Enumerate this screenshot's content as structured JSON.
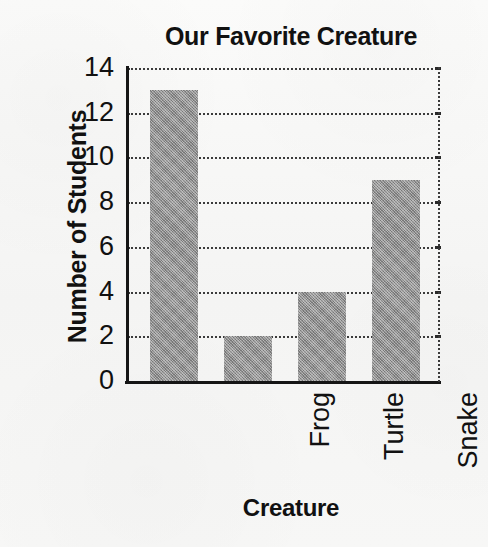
{
  "chart_data": {
    "type": "bar",
    "title": "Our Favorite Creature",
    "xlabel": "Creature",
    "ylabel": "Number of Students",
    "categories": [
      "Frog",
      "Turtle",
      "Snake",
      "Lizard"
    ],
    "values": [
      13,
      2,
      4,
      9
    ],
    "yticks": [
      0,
      2,
      4,
      6,
      8,
      10,
      12,
      14
    ],
    "ylim": [
      0,
      14
    ],
    "grid": true,
    "legend": "none",
    "bar_color": "#8d8d8d",
    "axis_color": "#151515",
    "grid_color": "#3b3b3b",
    "background_color": "#f6f6f5"
  }
}
